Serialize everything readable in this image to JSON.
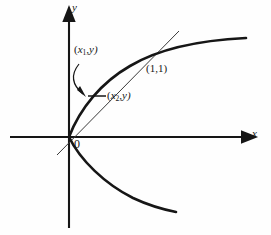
{
  "figure": {
    "type": "math-diagram",
    "background_color": "#fefefe",
    "ink_color": "#161616"
  },
  "axes": {
    "x_label": "x",
    "y_label": "y",
    "origin_label": "0",
    "x_axis": {
      "x1": 10,
      "y1": 137,
      "x2": 243,
      "y2": 137,
      "arrow": "right"
    },
    "y_axis": {
      "x1": 69,
      "y1": 228,
      "x2": 69,
      "y2": 20,
      "arrow": "up"
    }
  },
  "curve": {
    "name": "parabola",
    "upper_branch": "M 69 137 C 80 108, 102 82, 130 66 C 160 48, 205 40, 246 38",
    "lower_branch": "M 69 137 C 80 160, 105 184, 133 198 C 150 206, 166 210, 176 212"
  },
  "secant_line": {
    "name": "secant-through-origin",
    "x1": 57,
    "y1": 155,
    "x2": 179,
    "y2": 31
  },
  "connector": {
    "name": "horizontal-connector",
    "x1": 88,
    "y1": 96,
    "x2": 106,
    "y2": 96
  },
  "annotation_arrow": {
    "name": "callout-arrow",
    "path": "M 79 64 C 72 74, 72 84, 84 93",
    "tip": "M 84 93 L 78 89 L 81 87 Z"
  },
  "labels": {
    "x1_point": {
      "text": "(x1,y)",
      "open": "(",
      "var": "x",
      "sub": "1",
      "rest": ",y)",
      "x": 74,
      "y": 49
    },
    "x2_point": {
      "text": "(x2,y)",
      "open": "(",
      "var": "x",
      "sub": "2",
      "rest": ",y)",
      "x": 107,
      "y": 95
    },
    "intersection": {
      "text": "(1,1)",
      "x": 146,
      "y": 68
    },
    "origin": {
      "text": "0",
      "x": 74,
      "y": 140
    },
    "x_axis": {
      "text": "x",
      "x": 252,
      "y": 131
    },
    "y_axis": {
      "text": "y",
      "x": 72,
      "y": 4
    }
  }
}
